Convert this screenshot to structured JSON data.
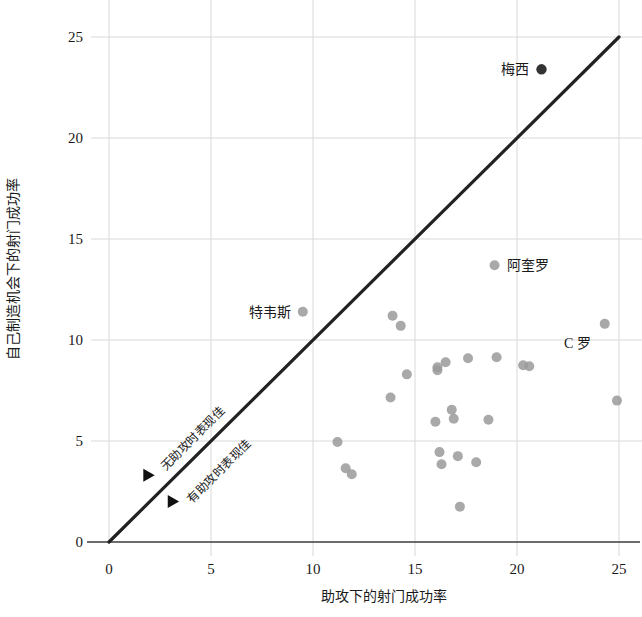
{
  "chart_data": {
    "type": "scatter",
    "title": "",
    "xlabel": "助攻下的射门成功率",
    "ylabel": "自己制造机会下的射门成功率",
    "xlim": [
      0,
      26
    ],
    "ylim": [
      0,
      26
    ],
    "xticks": [
      0,
      5,
      10,
      15,
      20,
      25
    ],
    "yticks": [
      0,
      5,
      10,
      15,
      20,
      25
    ],
    "xtick_labels": [
      "0",
      "5",
      "10",
      "15",
      "20",
      "25"
    ],
    "ytick_labels": [
      "0",
      "5",
      "10",
      "15",
      "20",
      "25"
    ],
    "grid": true,
    "grid_axis": "both",
    "legend": "none",
    "reference_line": {
      "name": "y = x 等值线",
      "from": [
        0,
        0
      ],
      "to": [
        25,
        25
      ],
      "color": "#222222"
    },
    "annotations": [
      {
        "text": "无助攻时表现佳",
        "x": 2.0,
        "y": 3.3,
        "rotation": -45,
        "marker": "triangle-right",
        "side": "above-line"
      },
      {
        "text": "有助攻时表现佳",
        "x": 3.2,
        "y": 2.0,
        "rotation": -45,
        "marker": "triangle-right",
        "side": "below-line"
      }
    ],
    "series": [
      {
        "name": "球员",
        "color": "#9a9a9a",
        "points": [
          {
            "x": 9.5,
            "y": 11.4,
            "label": "特韦斯",
            "label_pos": "left",
            "highlight": false
          },
          {
            "x": 18.9,
            "y": 13.7,
            "label": "阿奎罗",
            "label_pos": "right",
            "highlight": false
          },
          {
            "x": 21.2,
            "y": 23.4,
            "label": "梅西",
            "label_pos": "left",
            "highlight": true
          },
          {
            "x": 24.3,
            "y": 10.8,
            "label": "C 罗",
            "label_pos": "below-left",
            "highlight": false
          },
          {
            "x": 11.2,
            "y": 4.95,
            "label": "",
            "highlight": false
          },
          {
            "x": 11.6,
            "y": 3.65,
            "label": "",
            "highlight": false
          },
          {
            "x": 11.9,
            "y": 3.35,
            "label": "",
            "highlight": false
          },
          {
            "x": 13.8,
            "y": 7.15,
            "label": "",
            "highlight": false
          },
          {
            "x": 13.9,
            "y": 11.2,
            "label": "",
            "highlight": false
          },
          {
            "x": 14.3,
            "y": 10.7,
            "label": "",
            "highlight": false
          },
          {
            "x": 14.6,
            "y": 8.3,
            "label": "",
            "highlight": false
          },
          {
            "x": 16.0,
            "y": 5.95,
            "label": "",
            "highlight": false
          },
          {
            "x": 16.1,
            "y": 8.65,
            "label": "",
            "highlight": false
          },
          {
            "x": 16.1,
            "y": 8.5,
            "label": "",
            "highlight": false
          },
          {
            "x": 16.2,
            "y": 4.45,
            "label": "",
            "highlight": false
          },
          {
            "x": 16.3,
            "y": 3.85,
            "label": "",
            "highlight": false
          },
          {
            "x": 16.5,
            "y": 8.9,
            "label": "",
            "highlight": false
          },
          {
            "x": 16.8,
            "y": 6.55,
            "label": "",
            "highlight": false
          },
          {
            "x": 16.9,
            "y": 6.1,
            "label": "",
            "highlight": false
          },
          {
            "x": 17.1,
            "y": 4.25,
            "label": "",
            "highlight": false
          },
          {
            "x": 17.2,
            "y": 1.75,
            "label": "",
            "highlight": false
          },
          {
            "x": 17.6,
            "y": 9.1,
            "label": "",
            "highlight": false
          },
          {
            "x": 18.0,
            "y": 3.95,
            "label": "",
            "highlight": false
          },
          {
            "x": 18.6,
            "y": 6.05,
            "label": "",
            "highlight": false
          },
          {
            "x": 19.0,
            "y": 9.15,
            "label": "",
            "highlight": false
          },
          {
            "x": 20.3,
            "y": 8.75,
            "label": "",
            "highlight": false
          },
          {
            "x": 20.6,
            "y": 8.7,
            "label": "",
            "highlight": false
          },
          {
            "x": 24.9,
            "y": 7.0,
            "label": "",
            "highlight": false
          }
        ]
      }
    ]
  }
}
